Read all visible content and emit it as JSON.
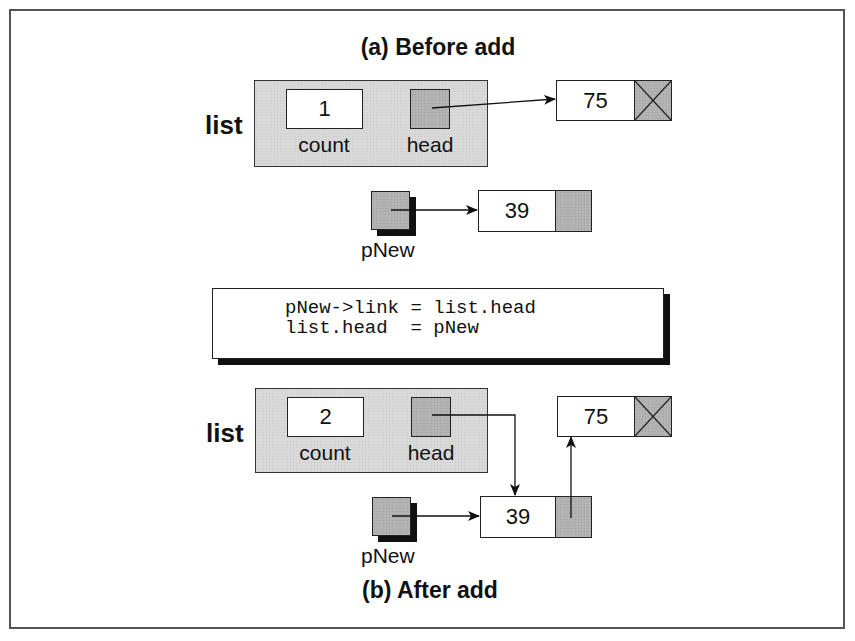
{
  "diagram": {
    "title_before": "(a) Before add",
    "title_after": "(b) After add",
    "before": {
      "list_label": "list",
      "count_value": "1",
      "count_label": "count",
      "head_label": "head",
      "node_existing": {
        "data": "75",
        "link": "null"
      },
      "pointer_label": "pNew",
      "node_new": {
        "data": "39",
        "link": "empty"
      }
    },
    "code": {
      "line1": "pNew->link = list.head",
      "line2": "list.head  = pNew"
    },
    "after": {
      "list_label": "list",
      "count_value": "2",
      "count_label": "count",
      "head_label": "head",
      "node_existing": {
        "data": "75",
        "link": "null"
      },
      "pointer_label": "pNew",
      "node_new": {
        "data": "39",
        "link": "points-to-75"
      }
    },
    "colors": {
      "struct_fill": "#d9d9d9",
      "pointer_fill": "#b3b3b3",
      "border": "#222222",
      "shadow": "#111111"
    }
  }
}
